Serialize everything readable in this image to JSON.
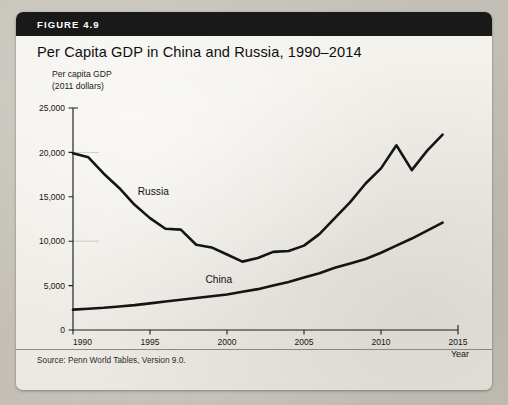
{
  "figure": {
    "banner_label": "FIGURE 4.9",
    "title": "Per Capita GDP in China and Russia, 1990–2014",
    "source": "Source: Penn World Tables, Version 9.0."
  },
  "axis_caption": {
    "line1": "Per capita GDP",
    "line2": "(2011 dollars)"
  },
  "chart_data": {
    "type": "line",
    "title": "Per Capita GDP in China and Russia, 1990–2014",
    "xlabel": "Year",
    "ylabel": "Per capita GDP (2011 dollars)",
    "xlim": [
      1990,
      2015
    ],
    "ylim": [
      0,
      25000
    ],
    "grid": false,
    "legend_position": "inline-annotation",
    "x_tick_labels": [
      "1990",
      "1995",
      "2000",
      "2005",
      "2010",
      "2015"
    ],
    "x_ticks": [
      1990,
      1995,
      2000,
      2005,
      2010,
      2015
    ],
    "y_tick_labels": [
      "0",
      "5,000",
      "10,000",
      "15,000",
      "20,000",
      "25,000"
    ],
    "y_ticks": [
      0,
      5000,
      10000,
      15000,
      20000,
      25000
    ],
    "x": [
      1990,
      1991,
      1992,
      1993,
      1994,
      1995,
      1996,
      1997,
      1998,
      1999,
      2000,
      2001,
      2002,
      2003,
      2004,
      2005,
      2006,
      2007,
      2008,
      2009,
      2010,
      2011,
      2012,
      2013,
      2014
    ],
    "series": [
      {
        "name": "Russia",
        "label": "Russia",
        "color": "#141414",
        "values": [
          19900,
          19450,
          17600,
          16000,
          14100,
          12600,
          11400,
          11300,
          9600,
          9300,
          8500,
          7700,
          8100,
          8800,
          8900,
          9500,
          10800,
          12600,
          14400,
          16500,
          18200,
          20800,
          18000,
          20200,
          22000
        ]
      },
      {
        "name": "China",
        "label": "China",
        "color": "#141414",
        "values": [
          2300,
          2400,
          2500,
          2650,
          2800,
          3000,
          3200,
          3400,
          3600,
          3800,
          4000,
          4300,
          4600,
          5000,
          5400,
          5900,
          6400,
          7000,
          7500,
          8000,
          8700,
          9500,
          10300,
          11200,
          12100
        ]
      }
    ],
    "annotations": [
      {
        "text": "Russia",
        "x": 1994.2,
        "y": 15200
      },
      {
        "text": "China",
        "x": 1998.6,
        "y": 5250
      }
    ]
  }
}
